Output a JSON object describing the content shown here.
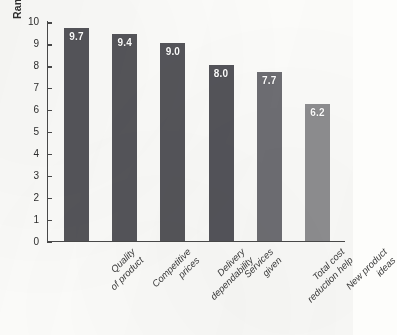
{
  "chart_data": {
    "type": "bar",
    "title": "",
    "xlabel": "",
    "ylabel": "Ranking of Importance",
    "ylim": [
      0,
      10
    ],
    "ytick_labels": [
      "10",
      "9",
      "8",
      "7",
      "6",
      "5",
      "4",
      "3",
      "2",
      "1",
      "0"
    ],
    "yticks": [
      10,
      9,
      8,
      7,
      6,
      5,
      4,
      3,
      2,
      1,
      0
    ],
    "grid": false,
    "legend": "none",
    "categories": [
      "Quality of product",
      "Competitive prices",
      "Delivery dependability",
      "Services given",
      "Total cost reduction help",
      "New product ideas"
    ],
    "category_lines": [
      [
        "Quality",
        "of product"
      ],
      [
        "Competitive",
        "prices"
      ],
      [
        "Delivery",
        "dependability"
      ],
      [
        "Services",
        "given"
      ],
      [
        "Total cost",
        "reduction help"
      ],
      [
        "New product",
        "ideas"
      ]
    ],
    "values": [
      9.7,
      9.4,
      9.0,
      8.0,
      7.7,
      6.2
    ],
    "value_labels": [
      "9.7",
      "9.4",
      "9.0",
      "8.0",
      "7.7",
      "6.2"
    ],
    "bar_colors": [
      "#55555a",
      "#55555a",
      "#55555a",
      "#54545a",
      "#6e6e73",
      "#8e8e90"
    ],
    "value_label_color": "#ffffff",
    "axis_color": "#4a4a4a",
    "background_color": "#fcfcfa"
  }
}
